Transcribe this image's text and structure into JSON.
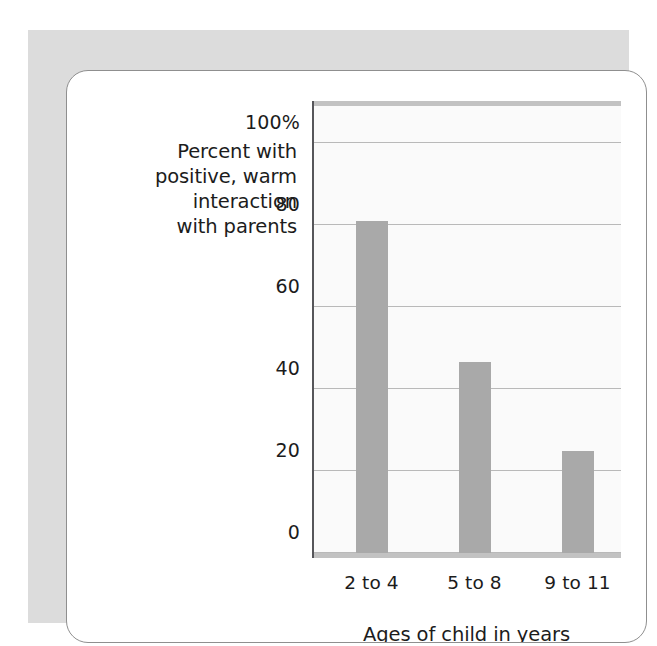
{
  "chart_data": {
    "type": "bar",
    "title": "",
    "subtitle": "",
    "categories": [
      "2 to 4",
      "5 to 8",
      "9 to 11"
    ],
    "values": [
      81,
      46.5,
      25
    ],
    "xlabel": "Ages of child in years",
    "ylabel": "Percent with\npositive, warm\ninteraction\nwith parents",
    "ylim": [
      0,
      100
    ],
    "xlim_categories": 3,
    "y_ticks": [
      0,
      20,
      40,
      60,
      80,
      100
    ],
    "y_tick_labels": [
      "0",
      "20",
      "40",
      "60",
      "80",
      "100%"
    ],
    "grid": "horizontal",
    "legend": "none",
    "bar_color": "#a9a9a9",
    "gridline_color": "#b9b9b9",
    "axis_color": "#56565a",
    "plot_background": "#fafafa",
    "frame_color": "#dcdcdc",
    "card_border_color": "#8f8f8f",
    "text_color": "#1c1c1c",
    "annotations": []
  }
}
